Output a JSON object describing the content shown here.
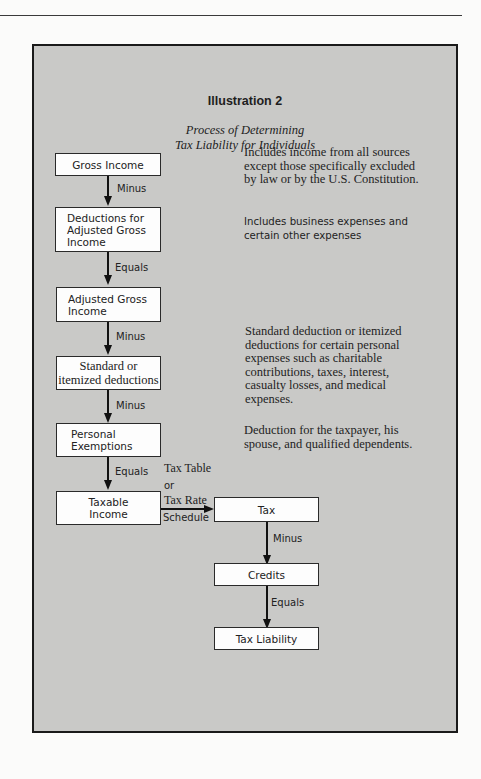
{
  "illustration": {
    "title": "Illustration 2",
    "subtitle_line1": "Process of Determining",
    "subtitle_line2": "Tax Liability for Individuals"
  },
  "boxes": [
    {
      "id": "gross-income",
      "lines": [
        "Gross Income"
      ]
    },
    {
      "id": "deductions-agi",
      "lines": [
        "Deductions for",
        "Adjusted Gross",
        "Income"
      ]
    },
    {
      "id": "agi",
      "lines": [
        "Adjusted Gross",
        "Income"
      ]
    },
    {
      "id": "standard-itemized",
      "lines": [
        "Standard or",
        "itemized deductions"
      ]
    },
    {
      "id": "personal-exemptions",
      "lines": [
        "Personal",
        "Exemptions"
      ]
    },
    {
      "id": "taxable-income",
      "lines": [
        "Taxable",
        "Income"
      ]
    },
    {
      "id": "tax",
      "lines": [
        "Tax"
      ]
    },
    {
      "id": "credits",
      "lines": [
        "Credits"
      ]
    },
    {
      "id": "tax-liability",
      "lines": [
        "Tax Liability"
      ]
    }
  ],
  "connectors": [
    {
      "from": "gross-income",
      "to": "deductions-agi",
      "label": "Minus"
    },
    {
      "from": "deductions-agi",
      "to": "agi",
      "label": "Equals"
    },
    {
      "from": "agi",
      "to": "standard-itemized",
      "label": "Minus"
    },
    {
      "from": "standard-itemized",
      "to": "personal-exemptions",
      "label": "Minus"
    },
    {
      "from": "personal-exemptions",
      "to": "taxable-income",
      "label": "Equals"
    },
    {
      "from": "taxable-income",
      "to": "tax",
      "label_above_1": "Tax Table",
      "label_above_2": "or",
      "label_above_3": "Tax Rate",
      "label_below": "Schedule"
    },
    {
      "from": "tax",
      "to": "credits",
      "label": "Minus"
    },
    {
      "from": "credits",
      "to": "tax-liability",
      "label": "Equals"
    }
  ],
  "descriptions": [
    {
      "for": "gross-income",
      "lines": [
        "Includes income from all sources",
        "except those specifically excluded",
        "by law or by the U.S. Constitution."
      ]
    },
    {
      "for": "deductions-agi",
      "lines": [
        "Includes business expenses and",
        "certain other expenses"
      ]
    },
    {
      "for": "standard-itemized",
      "lines": [
        "Standard deduction or itemized",
        "deductions for certain personal",
        "expenses such as charitable",
        "contributions, taxes, interest,",
        "casualty losses, and medical",
        "expenses."
      ]
    },
    {
      "for": "personal-exemptions",
      "lines": [
        "Deduction for the taxpayer, his",
        "spouse, and qualified dependents."
      ]
    }
  ]
}
